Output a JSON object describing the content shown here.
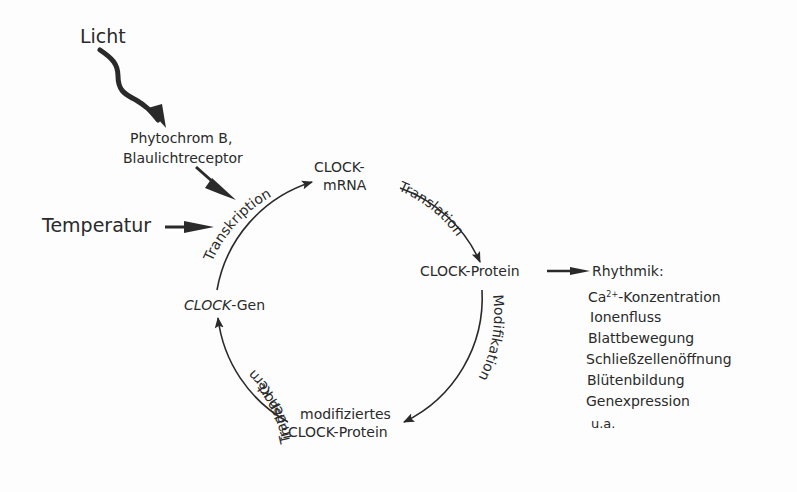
{
  "diagram": {
    "inputs": {
      "light": "Licht",
      "photoreceptors_line1": "Phytochrom B,",
      "photoreceptors_line2": "Blaulichtreceptor",
      "temperature": "Temperatur"
    },
    "cycle": {
      "nodes": {
        "mrna_line1": "CLOCK-",
        "mrna_line2": "mRNA",
        "protein": "CLOCK-Protein",
        "modified_line1": "modifiziertes",
        "modified_line2": "CLOCK-Protein",
        "gene_italic": "CLOCK",
        "gene_suffix": "-Gen"
      },
      "edges": {
        "transcription": "Transkription",
        "translation": "Translation",
        "modification": "Modifikation",
        "transport_line1": "Transport",
        "transport_line2": "in den Kern"
      }
    },
    "outputs": {
      "title": "Rhythmik:",
      "ca_prefix": "Ca",
      "ca_sup": "2+",
      "ca_suffix": "-Konzentration",
      "items": [
        "Ionenfluss",
        "Blattbewegung",
        "Schließzellenöffnung",
        "Blütenbildung",
        "Genexpression",
        "u.a."
      ]
    },
    "colors": {
      "ink": "#2a2a2a",
      "background": "#fdfdfd"
    }
  }
}
